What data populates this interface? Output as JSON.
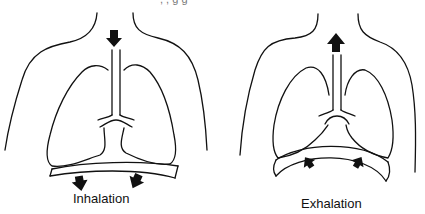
{
  "diagram": {
    "type": "breathing-mechanics",
    "top_text_cutoff": ", , g          g",
    "panels": [
      {
        "id": "inhalation",
        "label": "Inhalation",
        "airflow_direction": "down",
        "diaphragm_direction": "down",
        "diaphragm_shape": "flattened"
      },
      {
        "id": "exhalation",
        "label": "Exhalation",
        "airflow_direction": "up",
        "diaphragm_direction": "up",
        "diaphragm_shape": "domed"
      }
    ],
    "colors": {
      "stroke": "#111111",
      "fill": "#111111",
      "background": "#ffffff"
    }
  }
}
